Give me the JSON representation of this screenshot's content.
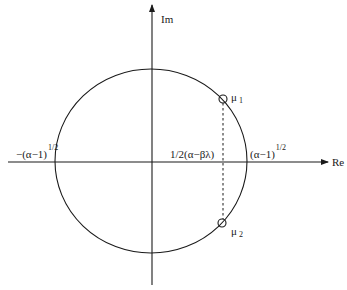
{
  "axes": {
    "x_label": "Re",
    "y_label": "Im"
  },
  "circle": {
    "center": "1/2(α−βλ)",
    "left_intercept_base": "−(α−1)",
    "left_intercept_exp": "1/2",
    "right_intercept_base": "(α−1)",
    "right_intercept_exp": "1/2"
  },
  "center_label": "1/2(α−βλ)",
  "points": [
    {
      "symbol": "μ",
      "subscript": "1"
    },
    {
      "symbol": "μ",
      "subscript": "2"
    }
  ],
  "colors": {
    "stroke": "#1a1a1a",
    "background": "#ffffff"
  }
}
